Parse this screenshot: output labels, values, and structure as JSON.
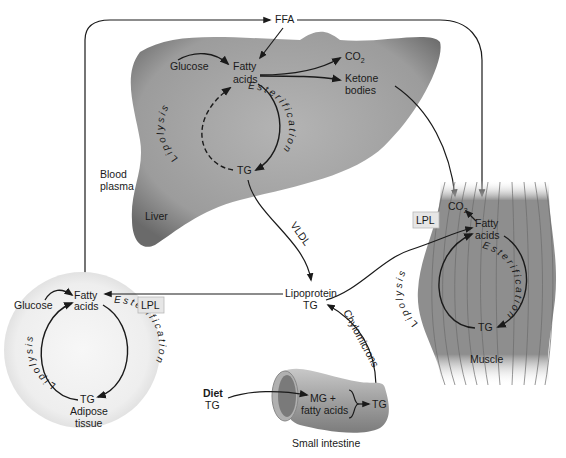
{
  "diagram": {
    "top_node": {
      "label": "FFA"
    },
    "blood_plasma": {
      "label_line1": "Blood",
      "label_line2": "plasma"
    },
    "liver": {
      "organ_label": "Liver",
      "glucose": "Glucose",
      "fatty_acids_line1": "Fatty",
      "fatty_acids_line2": "acids",
      "co2": "CO",
      "co2_sub": "2",
      "ketone_line1": "Ketone",
      "ketone_line2": "bodies",
      "tg": "TG",
      "esterification": "Esterification",
      "lipolysis": "Lipolysis"
    },
    "vldl": {
      "label": "VLDL"
    },
    "lipoprotein": {
      "label_line1": "Lipoprotein",
      "label_line2": "TG"
    },
    "chylomicrons": {
      "label": "Chylomicrons"
    },
    "muscle": {
      "organ_label": "Muscle",
      "co2": "CO",
      "co2_sub": "2",
      "fatty_acids_line1": "Fatty",
      "fatty_acids_line2": "acids",
      "tg": "TG",
      "lpl": "LPL",
      "esterification": "Esterification",
      "lipolysis": "Lipolysis"
    },
    "adipose": {
      "organ_label_line1": "Adipose",
      "organ_label_line2": "tissue",
      "glucose": "Glucose",
      "fatty_acids_line1": "Fatty",
      "fatty_acids_line2": "acids",
      "tg": "TG",
      "lpl": "LPL",
      "esterification": "Esterification",
      "lipolysis": "Lipolysis"
    },
    "intestine": {
      "organ_label": "Small intestine",
      "diet_line1": "Diet",
      "diet_line2": "TG",
      "mg_line1": "MG +",
      "mg_line2": "fatty acids",
      "tg": "TG"
    },
    "colors": {
      "liver_fill": "#9a9a9a",
      "muscle_fill": "#8c8c8c",
      "adipose_fill": "#efefef",
      "intestine_fill": "#a8a8a8",
      "line": "#1a1a1a"
    }
  }
}
